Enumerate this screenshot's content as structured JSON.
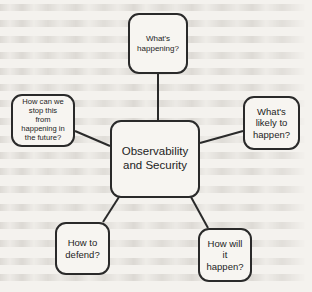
{
  "diagram": {
    "type": "mind-map",
    "title": "Observability and Security",
    "background_color": "#f4f2ee",
    "stroke_color": "#2a2a2a",
    "text_color": "#1d1d1d",
    "center": {
      "id": "center",
      "label": "Observability\nand Security"
    },
    "nodes": [
      {
        "id": "top",
        "label": "What's\nhappening?"
      },
      {
        "id": "right",
        "label": "What's\nlikely to\nhappen?"
      },
      {
        "id": "left",
        "label": "How can we\nstop this\nfrom\nhappening in\nthe future?"
      },
      {
        "id": "bottom-left",
        "label": "How to\ndefend?"
      },
      {
        "id": "bottom-right",
        "label": "How will\nit\nhappen?"
      }
    ],
    "connectors": [
      {
        "id": "center-to-top",
        "from": "center",
        "to": "top",
        "x1": 158,
        "y1": 120,
        "x2": 158,
        "y2": 74
      },
      {
        "id": "center-to-right",
        "from": "center",
        "to": "right",
        "x1": 200,
        "y1": 143,
        "x2": 243,
        "y2": 131
      },
      {
        "id": "center-to-left",
        "from": "center",
        "to": "left",
        "x1": 110,
        "y1": 146,
        "x2": 75,
        "y2": 131
      },
      {
        "id": "center-to-bottom-left",
        "from": "center",
        "to": "bottom-left",
        "x1": 119,
        "y1": 197,
        "x2": 103,
        "y2": 222
      },
      {
        "id": "center-to-bottom-right",
        "from": "center",
        "to": "bottom-right",
        "x1": 191,
        "y1": 197,
        "x2": 208,
        "y2": 228
      }
    ]
  }
}
